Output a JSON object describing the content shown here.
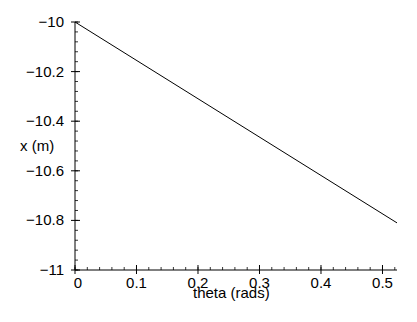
{
  "chart_data": {
    "type": "line",
    "title": "",
    "xlabel": "theta (rads)",
    "ylabel": "x (m)",
    "xlim": [
      0,
      0.5236
    ],
    "ylim": [
      -11,
      -10
    ],
    "grid": false,
    "legend": null,
    "x_ticks": [
      "0",
      "0.1",
      "0.2",
      "0.3",
      "0.4",
      "0.5"
    ],
    "x_tick_values": [
      0,
      0.1,
      0.2,
      0.3,
      0.4,
      0.5
    ],
    "y_ticks": [
      "-10",
      "-10.2",
      "-10.4",
      "-10.6",
      "-10.8",
      "-11"
    ],
    "y_tick_values": [
      -10,
      -10.2,
      -10.4,
      -10.6,
      -10.8,
      -11
    ],
    "series": [
      {
        "name": "x(theta)",
        "color": "#000000",
        "x": [
          0,
          0.5236
        ],
        "y": [
          -10,
          -10.81
        ]
      }
    ]
  }
}
